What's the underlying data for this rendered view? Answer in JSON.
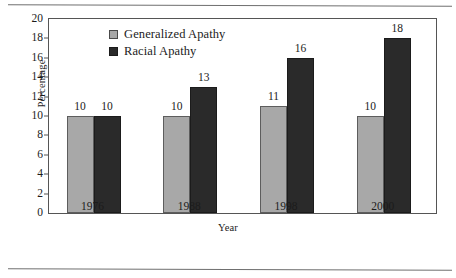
{
  "chart_data": {
    "type": "bar",
    "title": "",
    "xlabel": "Year",
    "ylabel": "Percentage",
    "categories": [
      "1976",
      "1988",
      "1998",
      "2000"
    ],
    "series": [
      {
        "name": "Generalized Apathy",
        "color": "#a8a8a8",
        "values": [
          10,
          10,
          11,
          10
        ],
        "labels": [
          "10",
          "10",
          "11",
          "10"
        ]
      },
      {
        "name": "Racial Apathy",
        "color": "#2a2a2a",
        "values": [
          10,
          13,
          16,
          18
        ],
        "labels": [
          "10",
          "13",
          "16",
          "18"
        ]
      }
    ],
    "ylim": [
      0,
      20
    ],
    "ytick_values": [
      0,
      2,
      4,
      6,
      8,
      10,
      12,
      14,
      16,
      18,
      20
    ],
    "ytick_labels": [
      "0",
      "2",
      "4",
      "6",
      "8",
      "10",
      "12",
      "14",
      "16",
      "18",
      "20"
    ],
    "grid": false,
    "legend_position": "top-left",
    "legend": [
      {
        "label": "Generalized Apathy",
        "swatch": "#a8a8a8"
      },
      {
        "label": "Racial Apathy",
        "swatch": "#2a2a2a"
      }
    ]
  }
}
